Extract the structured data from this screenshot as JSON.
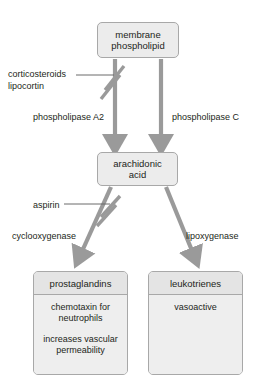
{
  "diagram": {
    "colors": {
      "box_fill": "#ececec",
      "header_fill": "#e4e4e4",
      "box_border": "#a8a8a8",
      "arrow": "#9a9a9a",
      "inhibitor_line": "#6b6b6b",
      "text": "#231f20",
      "background": "#ffffff"
    },
    "nodes": {
      "membrane": {
        "lines": [
          "membrane",
          "phospholipid"
        ]
      },
      "arachidonic": {
        "lines": [
          "arachidonic",
          "acid"
        ]
      },
      "prostaglandins": {
        "header": "prostaglandins",
        "entries": [
          "chemotaxin for neutrophils",
          "increases vascular permeability"
        ]
      },
      "leukotrienes": {
        "header": "leukotrienes",
        "entries": [
          "vasoactive"
        ]
      }
    },
    "enzymes": {
      "phospholipase_a2": "phospholipase A2",
      "phospholipase_c": "phospholipase C",
      "cyclooxygenase": "cyclooxygenase",
      "lipoxygenase": "lipoxygenase"
    },
    "inhibitors": {
      "corticosteroids": [
        "corticosteroids",
        "lipocortin"
      ],
      "aspirin": "aspirin"
    },
    "arrows": [
      {
        "name": "membrane-to-arachidonic-left",
        "inhibited": true
      },
      {
        "name": "membrane-to-arachidonic-right",
        "inhibited": false
      },
      {
        "name": "arachidonic-to-prostaglandins",
        "inhibited": true
      },
      {
        "name": "arachidonic-to-leukotrienes",
        "inhibited": false
      }
    ]
  }
}
